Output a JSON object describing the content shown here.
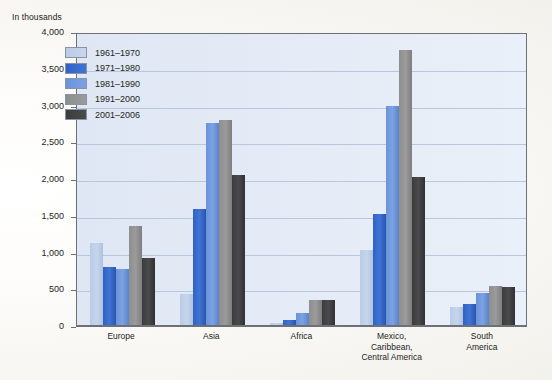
{
  "chart_data": {
    "type": "bar",
    "title": "",
    "ylabel": "In thousands",
    "xlabel": "",
    "ylim": [
      0,
      4000
    ],
    "ytick_labels": [
      "4,000",
      "3,500",
      "3,000",
      "2,500",
      "2,000",
      "1,500",
      "1,000",
      "500",
      "0"
    ],
    "ytick_values": [
      4000,
      3500,
      3000,
      2500,
      2000,
      1500,
      1000,
      500,
      0
    ],
    "grid": true,
    "legend_position": "top-left inside plot",
    "categories": [
      "Europe",
      "Asia",
      "Africa",
      "Mexico,\nCaribbean,\nCentral America",
      "South\nAmerica"
    ],
    "series": [
      {
        "name": "1961–1970",
        "color": "#c2d2ea",
        "values": [
          1130,
          430,
          35,
          1030,
          260
        ]
      },
      {
        "name": "1971–1980",
        "color": "#2f62c6",
        "values": [
          800,
          1590,
          80,
          1520,
          300
        ]
      },
      {
        "name": "1981–1990",
        "color": "#6a93da",
        "values": [
          780,
          2760,
          175,
          3000,
          450
        ]
      },
      {
        "name": "1991–2000",
        "color": "#8e8e8e",
        "values": [
          1360,
          2800,
          350,
          3750,
          540
        ]
      },
      {
        "name": "2001–2006",
        "color": "#3c3c3e",
        "values": [
          920,
          2060,
          350,
          2030,
          530
        ]
      }
    ]
  },
  "colors": {
    "plot_background_left": "#dfe7f4",
    "plot_background_right": "#eaf0f9",
    "gridline": "#b9c6dd",
    "axis": "#6c7077",
    "text": "#231f20",
    "page_background": "#fbfaf7"
  }
}
